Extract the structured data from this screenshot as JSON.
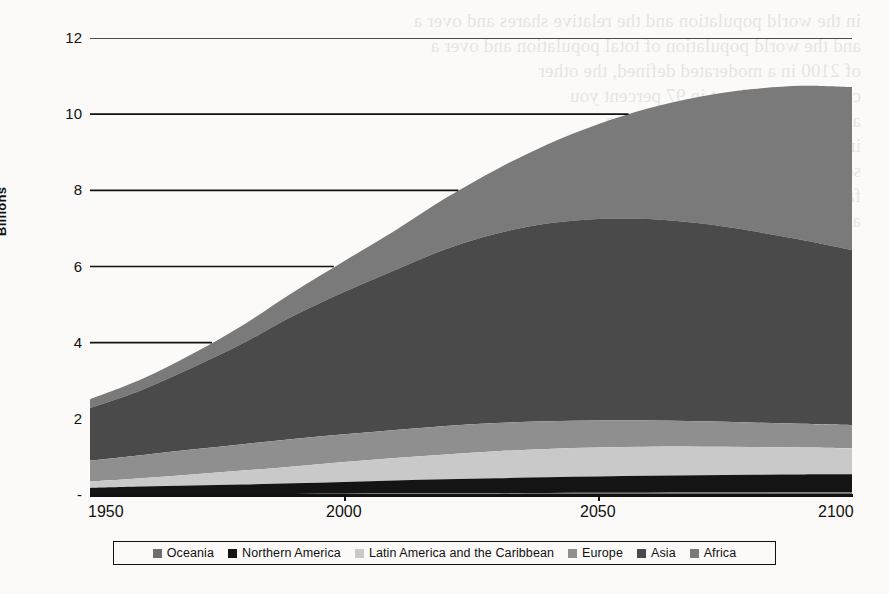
{
  "figure": {
    "y_axis_title": "Billions",
    "background_color": "#fbfaf8",
    "axis_color": "#111111"
  },
  "ghost": {
    "text": "in the world population and the relative shares and over a\nand the world population of total population and over a\nof 2100 in a moderated defined, the other\ncomparison at least in 97 percent you\nand anybody is for 100 percent a\nin the and of 1.5 million\nsome does not been\nfall of the\na"
  },
  "legend": {
    "items": [
      {
        "label": "Oceania",
        "color": "#6e6e6e"
      },
      {
        "label": "Northern America",
        "color": "#141414"
      },
      {
        "label": "Latin America and the Caribbean",
        "color": "#c9c9c9"
      },
      {
        "label": "Europe",
        "color": "#8f8f8f"
      },
      {
        "label": "Asia",
        "color": "#4a4a4a"
      },
      {
        "label": "Africa",
        "color": "#7a7a7a"
      }
    ]
  },
  "chart_data": {
    "type": "area",
    "stacked": true,
    "title": "",
    "xlabel": "",
    "ylabel": "Billions",
    "xlim": [
      1950,
      2100
    ],
    "ylim": [
      0,
      12
    ],
    "yticks": [
      0,
      2,
      4,
      6,
      8,
      10,
      12
    ],
    "ytick_labels": [
      "-",
      "2",
      "4",
      "6",
      "8",
      "10",
      "12"
    ],
    "xticks": [
      1950,
      2000,
      2050,
      2100
    ],
    "xtick_labels": [
      "1950",
      "2000",
      "2050",
      "2100"
    ],
    "grid": "horizontal",
    "legend_position": "bottom",
    "units": "billions of people",
    "x": [
      1950,
      1960,
      1970,
      1980,
      1990,
      2000,
      2010,
      2020,
      2030,
      2040,
      2050,
      2060,
      2070,
      2080,
      2090,
      2100
    ],
    "stack_order_bottom_to_top": [
      "Oceania",
      "Northern America",
      "Latin America and the Caribbean",
      "Europe",
      "Asia",
      "Africa"
    ],
    "series": [
      {
        "name": "Oceania",
        "color": "#6e6e6e",
        "values": [
          0.013,
          0.016,
          0.02,
          0.023,
          0.027,
          0.031,
          0.037,
          0.043,
          0.048,
          0.053,
          0.057,
          0.061,
          0.064,
          0.067,
          0.069,
          0.07
        ]
      },
      {
        "name": "Northern America",
        "color": "#141414",
        "values": [
          0.173,
          0.204,
          0.231,
          0.254,
          0.28,
          0.313,
          0.343,
          0.369,
          0.393,
          0.414,
          0.43,
          0.443,
          0.453,
          0.462,
          0.469,
          0.472
        ]
      },
      {
        "name": "Latin America and the Caribbean",
        "color": "#c9c9c9",
        "values": [
          0.169,
          0.221,
          0.287,
          0.364,
          0.443,
          0.522,
          0.591,
          0.654,
          0.706,
          0.744,
          0.762,
          0.764,
          0.753,
          0.733,
          0.707,
          0.68
        ]
      },
      {
        "name": "Europe",
        "color": "#8f8f8f",
        "values": [
          0.549,
          0.606,
          0.657,
          0.694,
          0.721,
          0.726,
          0.736,
          0.748,
          0.741,
          0.728,
          0.71,
          0.689,
          0.666,
          0.643,
          0.624,
          0.61
        ]
      },
      {
        "name": "Asia",
        "color": "#4a4a4a",
        "values": [
          1.379,
          1.7,
          2.138,
          2.642,
          3.226,
          3.736,
          4.194,
          4.641,
          4.974,
          5.19,
          5.29,
          5.288,
          5.197,
          5.035,
          4.833,
          4.6
        ]
      },
      {
        "name": "Africa",
        "color": "#7a7a7a",
        "values": [
          0.228,
          0.283,
          0.363,
          0.476,
          0.63,
          0.811,
          1.039,
          1.341,
          1.688,
          2.077,
          2.489,
          2.91,
          3.325,
          3.711,
          4.045,
          4.28
        ]
      }
    ],
    "totals": [
      2.511,
      3.03,
      3.696,
      4.453,
      5.327,
      6.139,
      6.94,
      7.796,
      8.55,
      9.206,
      9.738,
      10.155,
      10.458,
      10.651,
      10.747,
      10.712
    ],
    "annotations": []
  }
}
